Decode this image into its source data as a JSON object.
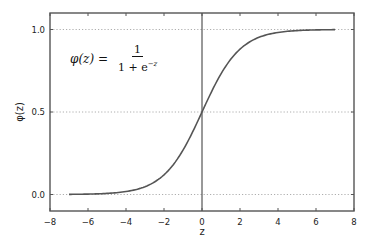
{
  "chart_data": {
    "type": "line",
    "title": "",
    "xlabel": "z",
    "ylabel": "φ(z)",
    "xlim": [
      -8,
      8
    ],
    "ylim": [
      -0.1,
      1.1
    ],
    "x_ticks": [
      -8,
      -6,
      -4,
      -2,
      0,
      2,
      4,
      6,
      8
    ],
    "x_tick_labels": [
      "−8",
      "−6",
      "−4",
      "−2",
      "0",
      "2",
      "4",
      "6",
      "8"
    ],
    "y_ticks": [
      0.0,
      0.5,
      1.0
    ],
    "y_tick_labels": [
      "0.0",
      "0.5",
      "1.0"
    ],
    "grid": "horizontal dotted at y ticks",
    "vertical_reference_line": 0,
    "annotation": {
      "lhs": "φ(z) =",
      "numerator": "1",
      "denominator_base": "1 + e",
      "denominator_exp": "−z"
    },
    "series": [
      {
        "name": "sigmoid",
        "function": "1/(1+exp(-z))",
        "x": [
          -7,
          -6,
          -5,
          -4,
          -3,
          -2,
          -1,
          0,
          1,
          2,
          3,
          4,
          5,
          6,
          7
        ],
        "values": [
          0.001,
          0.002,
          0.007,
          0.018,
          0.047,
          0.119,
          0.269,
          0.5,
          0.731,
          0.881,
          0.953,
          0.982,
          0.993,
          0.998,
          0.999
        ],
        "color": "#555555"
      }
    ]
  }
}
